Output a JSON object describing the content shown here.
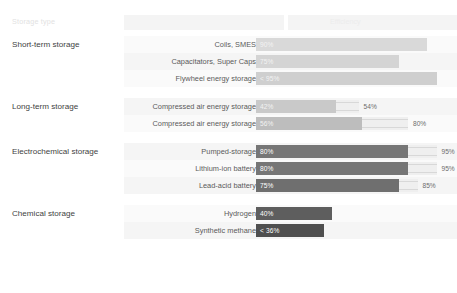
{
  "chart_data": {
    "type": "bar",
    "title": "",
    "xlabel": "",
    "ylabel": "",
    "xlim": [
      0,
      100
    ],
    "grid": false,
    "legend": "none",
    "header": {
      "col1": "Storage type",
      "col2": "Efficiency"
    },
    "annotation": "range min-max efficiency",
    "groups": [
      {
        "label": "Short-term storage",
        "rows": [
          {
            "label": "Coils, SMES",
            "value": 90,
            "value_text": "90%",
            "max": null,
            "max_text": ""
          },
          {
            "label": "Capacitators, Super Caps",
            "value": 75,
            "value_text": "75%",
            "max": null,
            "max_text": ""
          },
          {
            "label": "Flywheel energy storage",
            "value": 95,
            "value_text": "< 95%",
            "max": null,
            "max_text": ""
          }
        ]
      },
      {
        "label": "Long-term storage",
        "rows": [
          {
            "label": "Compressed air energy storage",
            "value": 42,
            "value_text": "42%",
            "max": 54,
            "max_text": "54%"
          },
          {
            "label": "Compressed air energy storage",
            "value": 56,
            "value_text": "56%",
            "max": 80,
            "max_text": "80%"
          }
        ]
      },
      {
        "label": "Electrochemical storage",
        "rows": [
          {
            "label": "Pumped-storage",
            "value": 80,
            "value_text": "80%",
            "max": 95,
            "max_text": "95%"
          },
          {
            "label": "Lithium-ion battery",
            "value": 80,
            "value_text": "80%",
            "max": 95,
            "max_text": "95%"
          },
          {
            "label": "Lead-acid battery",
            "value": 75,
            "value_text": "75%",
            "max": 85,
            "max_text": "85%"
          }
        ]
      },
      {
        "label": "Chemical storage",
        "rows": [
          {
            "label": "Hydrogen",
            "value": 40,
            "value_text": "40%",
            "max": null,
            "max_text": ""
          },
          {
            "label": "Synthetic methane",
            "value": 36,
            "value_text": "< 36%",
            "max": null,
            "max_text": ""
          }
        ]
      }
    ]
  }
}
